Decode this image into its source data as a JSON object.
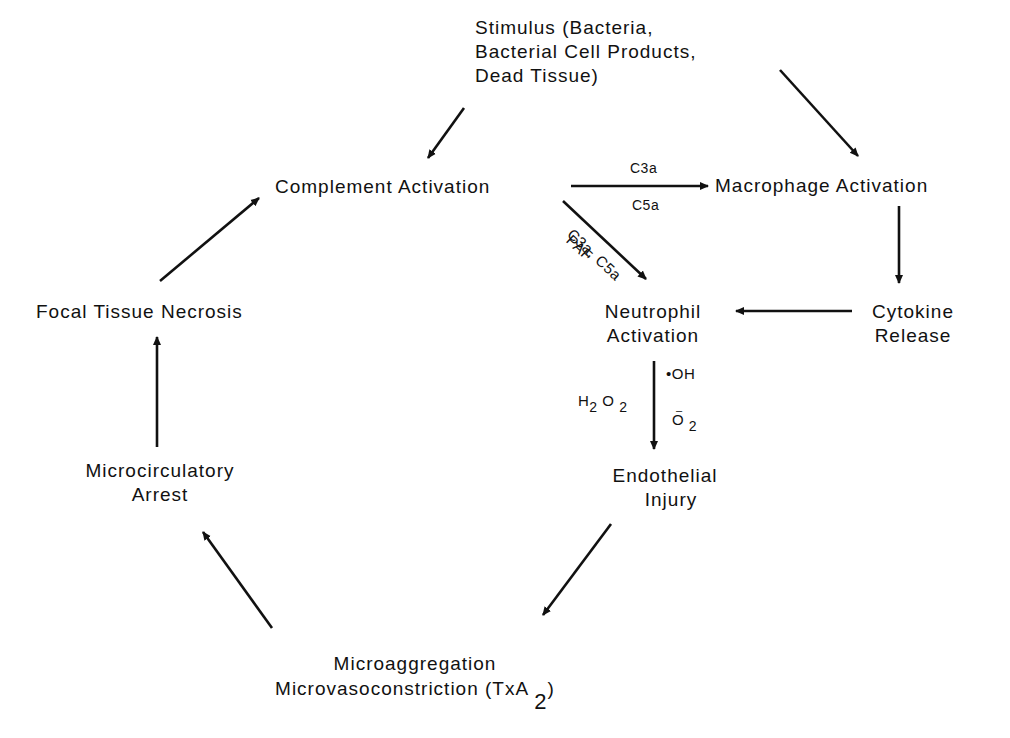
{
  "diagram": {
    "nodes": {
      "stimulus": [
        "Stimulus (Bacteria,",
        "Bacterial Cell Products,",
        "Dead Tissue)"
      ],
      "complement": "Complement Activation",
      "macrophage": "Macrophage Activation",
      "cytokine": [
        "Cytokine",
        "Release"
      ],
      "neutrophil": [
        "Neutrophil",
        "Activation"
      ],
      "endothelial": [
        "Endothelial",
        "Injury"
      ],
      "microaggregation": [
        "Microaggregation",
        "Microvasoconstriction (TxA",
        "2",
        ")"
      ],
      "microcirculatory": [
        "Microcirculatory",
        "Arrest"
      ],
      "necrosis": "Focal Tissue Necrosis"
    },
    "edge_labels": {
      "complement_to_macrophage_top": "C3a",
      "complement_to_macrophage_bottom": "C5a",
      "complement_to_neutrophil_upper": "C3a, C5a",
      "complement_to_neutrophil_lower": "PAF",
      "neutrophil_to_endothelial_oh": "•OH",
      "neutrophil_to_endothelial_h2o2": [
        "H",
        "2",
        "O",
        "2"
      ],
      "neutrophil_to_endothelial_o2": [
        "O",
        "–",
        "2"
      ]
    },
    "edges": [
      {
        "from": "stimulus",
        "to": "complement"
      },
      {
        "from": "stimulus",
        "to": "macrophage"
      },
      {
        "from": "complement",
        "to": "macrophage"
      },
      {
        "from": "complement",
        "to": "neutrophil"
      },
      {
        "from": "macrophage",
        "to": "cytokine"
      },
      {
        "from": "cytokine",
        "to": "neutrophil"
      },
      {
        "from": "neutrophil",
        "to": "endothelial"
      },
      {
        "from": "endothelial",
        "to": "microaggregation"
      },
      {
        "from": "microaggregation",
        "to": "microcirculatory"
      },
      {
        "from": "microcirculatory",
        "to": "necrosis"
      },
      {
        "from": "necrosis",
        "to": "complement"
      }
    ]
  }
}
